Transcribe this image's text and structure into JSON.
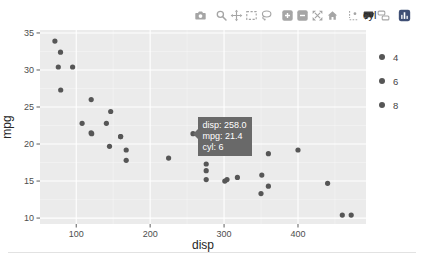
{
  "colors": {
    "plot_background": "#ebebeb",
    "grid": "#ffffff",
    "marker": "#565656",
    "tick_label": "#4d4d4d",
    "axis_title": "#262626",
    "tooltip_background": "#696969",
    "tooltip_text": "#ffffff",
    "modebar_icon": "#a5a5a5",
    "modebar_icon_active": "#3d3d3d",
    "logo_background": "#3f4f75",
    "legend_text": "#444444",
    "divider": "#e2e2e2"
  },
  "modebar": {
    "active_button": "hover-closest",
    "groups": [
      [
        "camera"
      ],
      [
        "zoom",
        "pan",
        "box-select",
        "lasso-select"
      ],
      [
        "zoom-in",
        "zoom-out",
        "autoscale",
        "reset-axes"
      ],
      [
        "spikelines",
        "hover-closest",
        "hover-compare"
      ],
      [
        "plotly-logo"
      ]
    ]
  },
  "legend": {
    "title": "cyl",
    "items": [
      {
        "label": "4"
      },
      {
        "label": "6"
      },
      {
        "label": "8"
      }
    ]
  },
  "tooltip": {
    "lines": [
      "disp: 258.0",
      "mpg: 21.4",
      "cyl: 6"
    ]
  },
  "chart_data": {
    "type": "scatter",
    "title": "",
    "xlabel": "disp",
    "ylabel": "mpg",
    "xlim": [
      51,
      492
    ],
    "ylim": [
      9.2,
      35.4
    ],
    "x_ticks": [
      100,
      200,
      300,
      400
    ],
    "y_ticks": [
      10,
      15,
      20,
      25,
      30,
      35
    ],
    "x_minor": [
      150,
      250,
      350,
      450
    ],
    "y_minor": [
      12.5,
      17.5,
      22.5,
      27.5,
      32.5
    ],
    "grid": true,
    "legend_position": "right",
    "legend_title": "cyl",
    "series": [
      {
        "name": "4",
        "points": [
          [
            108,
            22.8
          ],
          [
            146.7,
            24.4
          ],
          [
            140.8,
            22.8
          ],
          [
            78.7,
            32.4
          ],
          [
            75.7,
            30.4
          ],
          [
            71.1,
            33.9
          ],
          [
            120.1,
            21.5
          ],
          [
            79,
            27.3
          ],
          [
            120.3,
            26
          ],
          [
            95.1,
            30.4
          ],
          [
            121,
            21.4
          ]
        ]
      },
      {
        "name": "6",
        "points": [
          [
            160,
            21
          ],
          [
            160,
            21
          ],
          [
            258,
            21.4
          ],
          [
            225,
            18.1
          ],
          [
            167.6,
            19.2
          ],
          [
            167.6,
            17.8
          ],
          [
            145,
            19.7
          ]
        ]
      },
      {
        "name": "8",
        "points": [
          [
            360,
            18.7
          ],
          [
            360,
            14.3
          ],
          [
            275.8,
            16.4
          ],
          [
            275.8,
            17.3
          ],
          [
            275.8,
            15.2
          ],
          [
            472,
            10.4
          ],
          [
            460,
            10.4
          ],
          [
            440,
            14.7
          ],
          [
            318,
            15.5
          ],
          [
            304,
            15.2
          ],
          [
            350,
            13.3
          ],
          [
            400,
            19.2
          ],
          [
            351,
            15.8
          ],
          [
            301,
            15
          ]
        ]
      }
    ],
    "hovered_point": {
      "disp": 258.0,
      "mpg": 21.4,
      "cyl": 6
    }
  }
}
